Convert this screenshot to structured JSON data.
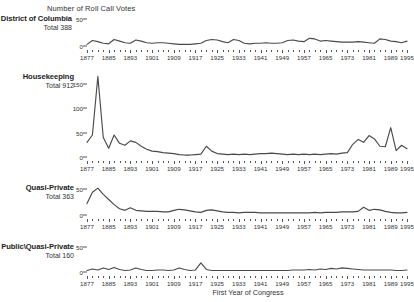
{
  "header": {
    "title": "Number of Roll Call Votes"
  },
  "axis": {
    "x_title": "First Year of Congress",
    "tick_start": 1877,
    "tick_step": 2,
    "tick_end": 1995,
    "labels": [
      1877,
      1885,
      1893,
      1901,
      1909,
      1917,
      1925,
      1933,
      1941,
      1949,
      1957,
      1965,
      1973,
      1981,
      1989,
      1995
    ]
  },
  "colors": {
    "line": "#4a4a4a",
    "text": "#2b2b2b",
    "axis": "#555555"
  },
  "panels": [
    {
      "name": "District of Columbia",
      "total_label": "Total 388"
    },
    {
      "name": "Housekeeping",
      "total_label": "Total 912"
    },
    {
      "name": "Quasi-Private",
      "total_label": "Total 363"
    },
    {
      "name": "Public\\Quasi-Private",
      "total_label": "Total 160"
    }
  ],
  "chart_data": {
    "type": "line",
    "title": "Number of Roll Call Votes",
    "xlabel": "First Year of Congress",
    "ylabel": "Number of Roll Call Votes",
    "grid": false,
    "legend": "none",
    "layout": "small-multiples, 4 stacked panels sharing x axis",
    "x": [
      1877,
      1879,
      1881,
      1883,
      1885,
      1887,
      1889,
      1891,
      1893,
      1895,
      1897,
      1899,
      1901,
      1903,
      1905,
      1907,
      1909,
      1911,
      1913,
      1915,
      1917,
      1919,
      1921,
      1923,
      1925,
      1927,
      1929,
      1931,
      1933,
      1935,
      1937,
      1939,
      1941,
      1943,
      1945,
      1947,
      1949,
      1951,
      1953,
      1955,
      1957,
      1959,
      1961,
      1963,
      1965,
      1967,
      1969,
      1971,
      1973,
      1975,
      1977,
      1979,
      1981,
      1983,
      1985,
      1987,
      1989,
      1991,
      1993,
      1995
    ],
    "panels": [
      {
        "name": "District of Columbia",
        "total": 388,
        "total_label": "Total 388",
        "ylim": [
          0,
          55
        ],
        "yticks": [
          0,
          50
        ],
        "ytick_labels": [
          "0",
          "50"
        ],
        "values": [
          3,
          10,
          8,
          5,
          4,
          12,
          9,
          6,
          5,
          11,
          9,
          6,
          5,
          6,
          6,
          5,
          4,
          3,
          3,
          3,
          4,
          5,
          10,
          12,
          11,
          8,
          6,
          12,
          10,
          5,
          4,
          5,
          5,
          6,
          5,
          5,
          6,
          10,
          11,
          9,
          8,
          14,
          13,
          9,
          10,
          9,
          8,
          7,
          7,
          7,
          8,
          7,
          6,
          5,
          13,
          12,
          9,
          8,
          6,
          9
        ]
      },
      {
        "name": "Housekeeping",
        "total": 912,
        "total_label": "Total 912",
        "ylim": [
          0,
          170
        ],
        "yticks": [
          0,
          50,
          100,
          150
        ],
        "ytick_labels": [
          "0",
          "50",
          "100",
          "150"
        ],
        "values": [
          30,
          45,
          165,
          40,
          18,
          45,
          28,
          24,
          33,
          30,
          22,
          16,
          12,
          11,
          9,
          8,
          7,
          5,
          4,
          4,
          5,
          6,
          22,
          12,
          7,
          6,
          5,
          6,
          5,
          6,
          5,
          6,
          7,
          7,
          8,
          7,
          6,
          5,
          6,
          5,
          6,
          5,
          6,
          5,
          6,
          7,
          6,
          8,
          9,
          26,
          36,
          30,
          44,
          37,
          22,
          21,
          60,
          13,
          24,
          17
        ]
      },
      {
        "name": "Quasi-Private",
        "total": 363,
        "total_label": "Total 363",
        "ylim": [
          0,
          58
        ],
        "yticks": [
          0,
          50
        ],
        "ytick_labels": [
          "0",
          "50"
        ],
        "values": [
          22,
          44,
          52,
          40,
          30,
          20,
          12,
          9,
          14,
          9,
          8,
          7,
          7,
          7,
          6,
          6,
          9,
          11,
          10,
          8,
          6,
          5,
          9,
          10,
          8,
          6,
          5,
          5,
          4,
          5,
          5,
          5,
          4,
          4,
          4,
          4,
          4,
          4,
          4,
          4,
          4,
          4,
          5,
          4,
          5,
          5,
          5,
          6,
          6,
          6,
          7,
          15,
          9,
          11,
          10,
          7,
          5,
          4,
          4,
          5
        ]
      },
      {
        "name": "Public\\Quasi-Private",
        "total": 160,
        "total_label": "Total 160",
        "ylim": [
          0,
          55
        ],
        "yticks": [
          0,
          50
        ],
        "ytick_labels": [
          "0",
          "50"
        ],
        "values": [
          3,
          6,
          4,
          8,
          5,
          9,
          5,
          3,
          4,
          8,
          5,
          3,
          3,
          4,
          4,
          3,
          4,
          8,
          5,
          3,
          4,
          18,
          5,
          3,
          3,
          3,
          3,
          3,
          3,
          3,
          3,
          3,
          3,
          3,
          3,
          3,
          3,
          3,
          4,
          4,
          4,
          5,
          4,
          6,
          5,
          7,
          6,
          8,
          7,
          6,
          5,
          4,
          4,
          4,
          4,
          4,
          4,
          3,
          3,
          4
        ]
      }
    ]
  }
}
